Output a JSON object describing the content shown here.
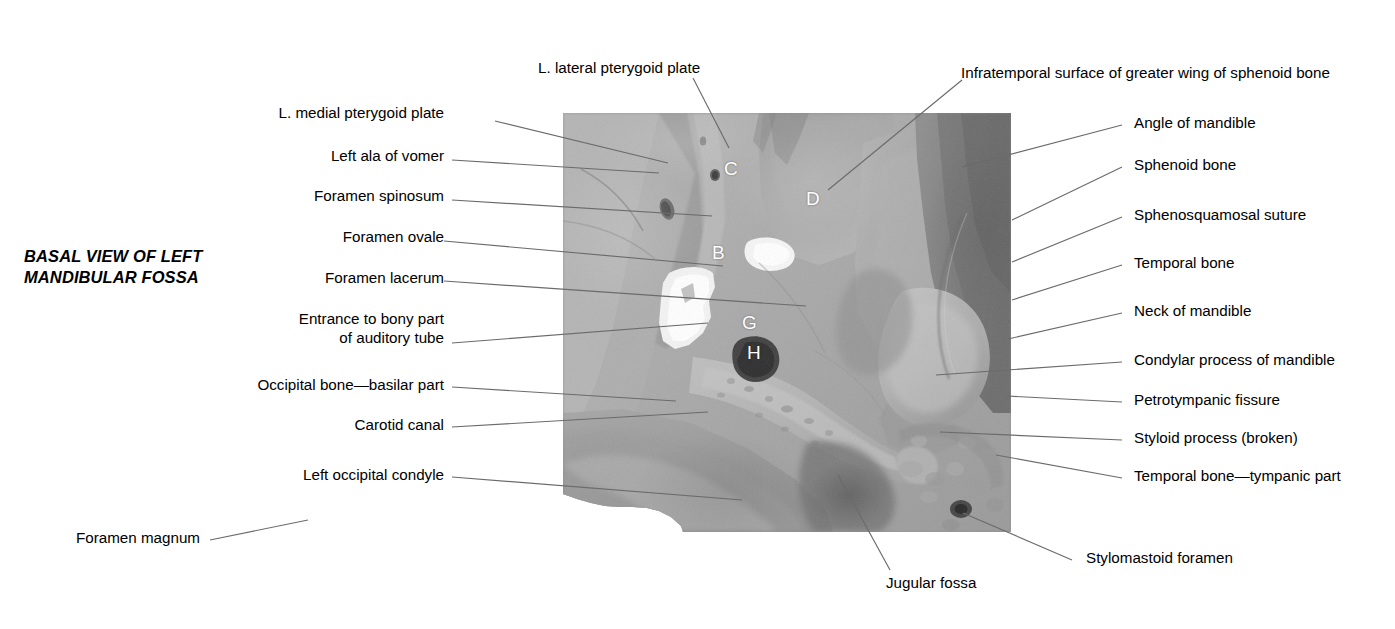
{
  "figure": {
    "title_line1": "BASAL VIEW OF LEFT",
    "title_line2": "MANDIBULAR FOSSA",
    "background_color": "#ffffff",
    "leader_line_color": "#6b6b6b",
    "text_color": "#000000"
  },
  "photo": {
    "description": "Grayscale photograph of a dried skull base, left mandibular fossa region",
    "letter_annotation_color": "#ffffff"
  },
  "labels_left": [
    {
      "id": "l-medial-pterygoid-plate",
      "text": "L. medial pterygoid plate"
    },
    {
      "id": "left-ala-of-vomer",
      "text": "Left ala of vomer"
    },
    {
      "id": "foramen-spinosum",
      "text": "Foramen spinosum"
    },
    {
      "id": "foramen-ovale",
      "text": "Foramen ovale"
    },
    {
      "id": "foramen-lacerum",
      "text": "Foramen lacerum"
    },
    {
      "id": "entrance-to-auditory-tube-line1",
      "text": "Entrance to bony part"
    },
    {
      "id": "entrance-to-auditory-tube-line2",
      "text": "of auditory tube"
    },
    {
      "id": "occipital-bone-basilar-part",
      "text": "Occipital bone—basilar part"
    },
    {
      "id": "carotid-canal",
      "text": "Carotid canal"
    },
    {
      "id": "left-occipital-condyle",
      "text": "Left occipital condyle"
    },
    {
      "id": "foramen-magnum",
      "text": "Foramen magnum"
    }
  ],
  "labels_top": [
    {
      "id": "l-lateral-pterygoid-plate",
      "text": "L. lateral pterygoid plate"
    },
    {
      "id": "infratemporal-surface",
      "text": "Infratemporal surface of greater wing of sphenoid bone"
    }
  ],
  "labels_right": [
    {
      "id": "angle-of-mandible",
      "text": "Angle of mandible"
    },
    {
      "id": "sphenoid-bone",
      "text": "Sphenoid bone"
    },
    {
      "id": "sphenosquamosal-suture",
      "text": "Sphenosquamosal suture"
    },
    {
      "id": "temporal-bone",
      "text": "Temporal bone"
    },
    {
      "id": "neck-of-mandible",
      "text": "Neck of mandible"
    },
    {
      "id": "condylar-process-of-mandible",
      "text": "Condylar process of mandible"
    },
    {
      "id": "petrotympanic-fissure",
      "text": "Petrotympanic fissure"
    },
    {
      "id": "styloid-process-broken",
      "text": "Styloid process (broken)"
    },
    {
      "id": "temporal-bone-tympanic-part",
      "text": "Temporal bone—tympanic part"
    },
    {
      "id": "stylomastoid-foramen",
      "text": "Stylomastoid foramen"
    }
  ],
  "labels_bottom": [
    {
      "id": "jugular-fossa",
      "text": "Jugular fossa"
    }
  ],
  "photo_letters": [
    {
      "id": "letter-c",
      "text": "C"
    },
    {
      "id": "letter-d",
      "text": "D"
    },
    {
      "id": "letter-b",
      "text": "B"
    },
    {
      "id": "letter-g",
      "text": "G"
    },
    {
      "id": "letter-h",
      "text": "H"
    }
  ]
}
